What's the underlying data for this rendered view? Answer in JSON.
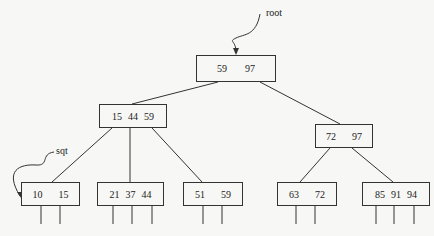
{
  "diagram": {
    "type": "B+ tree",
    "labels": {
      "root": "root",
      "sqt": "sqt"
    },
    "nodes": {
      "root": {
        "keys": [
          "59",
          "97"
        ]
      },
      "internal_left": {
        "keys": [
          "15",
          "44",
          "59"
        ]
      },
      "internal_right": {
        "keys": [
          "72",
          "97"
        ]
      },
      "leaf1": {
        "keys": [
          "10",
          "15"
        ]
      },
      "leaf2": {
        "keys": [
          "21",
          "37",
          "44"
        ]
      },
      "leaf3": {
        "keys": [
          "51",
          "59"
        ]
      },
      "leaf4": {
        "keys": [
          "63",
          "72"
        ]
      },
      "leaf5": {
        "keys": [
          "85",
          "91",
          "94"
        ]
      }
    }
  }
}
